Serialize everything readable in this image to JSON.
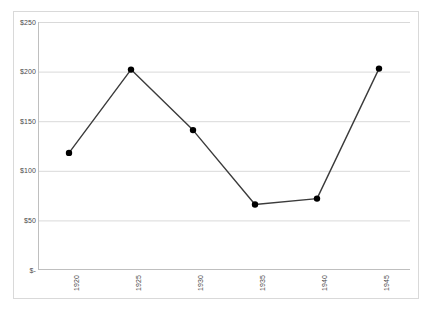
{
  "chart_data": {
    "type": "line",
    "title": "",
    "xlabel": "",
    "ylabel": "",
    "categories": [
      "1920",
      "1925",
      "1930",
      "1935",
      "1940",
      "1945"
    ],
    "values": [
      118,
      202,
      141,
      66,
      72,
      203
    ],
    "series": [
      {
        "name": "",
        "values": [
          118,
          202,
          141,
          66,
          72,
          203
        ]
      }
    ],
    "ylim": [
      0,
      250
    ],
    "y_ticks": [
      0,
      50,
      100,
      150,
      200,
      250
    ],
    "y_tick_labels": [
      "$-",
      "$50",
      "$100",
      "$150",
      "$200",
      "$250"
    ],
    "x_tick_labels": [
      "1920",
      "1925",
      "1930",
      "1935",
      "1940",
      "1945"
    ],
    "x_tick_rotation": 90,
    "grid": true,
    "grid_axis": "y",
    "legend": false,
    "legend_position": "none",
    "annotations": [],
    "colors": {
      "line": "#3b3b3b",
      "marker": "#000000",
      "grid": "#d9d9d9",
      "axis": "#bfbfbf",
      "frame": "#d9d9d9",
      "text": "#4a4a4a",
      "background": "#ffffff"
    },
    "marker_style": "circle",
    "marker_size": 4
  }
}
